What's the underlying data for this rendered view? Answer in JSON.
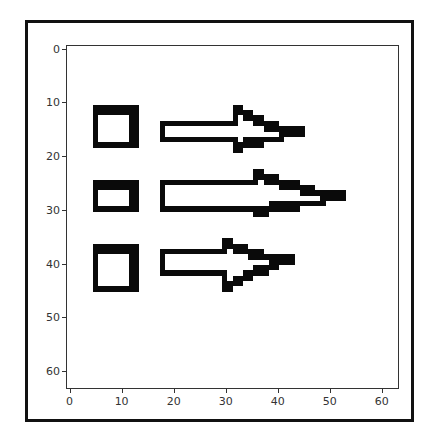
{
  "chart_data": {
    "type": "heatmap",
    "title": "",
    "xlabel": "",
    "ylabel": "",
    "image_size": [
      64,
      64
    ],
    "xlim": [
      -0.5,
      63.5
    ],
    "ylim": [
      63.5,
      -0.5
    ],
    "x_ticks": [
      0,
      10,
      20,
      30,
      40,
      50,
      60
    ],
    "y_ticks": [
      0,
      10,
      20,
      30,
      40,
      50,
      60
    ],
    "colormap": "gray (binary: black shapes on white)",
    "grid": false,
    "legend": null,
    "shapes": [
      {
        "kind": "square",
        "label": "square-1",
        "rows": [
          11,
          18
        ],
        "cols": [
          5,
          13
        ]
      },
      {
        "kind": "arrow",
        "label": "arrow-1",
        "shaft_rows": [
          14,
          17
        ],
        "shaft_cols": [
          18,
          32
        ],
        "head_rows": [
          11,
          19
        ],
        "head_cols": [
          32,
          42
        ],
        "tip_col": 45
      },
      {
        "kind": "square",
        "label": "square-2",
        "rows": [
          25,
          30
        ],
        "cols": [
          5,
          13
        ]
      },
      {
        "kind": "arrow",
        "label": "arrow-2",
        "shaft_rows": [
          25,
          30
        ],
        "shaft_cols": [
          18,
          36
        ],
        "head_rows": [
          23,
          31
        ],
        "head_cols": [
          36,
          50
        ],
        "tip_col": 53
      },
      {
        "kind": "square",
        "label": "square-3",
        "rows": [
          37,
          45
        ],
        "cols": [
          5,
          13
        ]
      },
      {
        "kind": "arrow",
        "label": "arrow-3",
        "shaft_rows": [
          38,
          42
        ],
        "shaft_cols": [
          18,
          30
        ],
        "head_rows": [
          36,
          45
        ],
        "head_cols": [
          30,
          40
        ],
        "tip_col": 43
      }
    ]
  },
  "axes": {
    "x_tick_labels": [
      "0",
      "10",
      "20",
      "30",
      "40",
      "50",
      "60"
    ],
    "y_tick_labels": [
      "0",
      "10",
      "20",
      "30",
      "40",
      "50",
      "60"
    ]
  }
}
